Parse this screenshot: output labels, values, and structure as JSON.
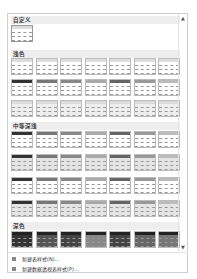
{
  "gallery": {
    "sections": [
      {
        "label": "自定义",
        "rows": 1,
        "cols": 1
      },
      {
        "label": "浅色",
        "rows": 3,
        "cols": 7
      },
      {
        "label": "中等深浅",
        "rows": 4,
        "cols": 7
      },
      {
        "label": "深色",
        "rows": 1,
        "cols": 7
      }
    ],
    "scroll_up_icon": "▲",
    "scroll_down_icon": "▼"
  },
  "menu": {
    "items": [
      {
        "label": "新建表样式(N)...",
        "icon": "new-table-style-icon"
      },
      {
        "label": "新建数据透视表样式(P)...",
        "icon": "new-pivot-style-icon"
      }
    ]
  },
  "colors": {
    "light_header": [
      "#333333",
      "#777777",
      "#888888",
      "#aaaaaa",
      "#666666",
      "#999999",
      "#bbbbbb"
    ],
    "dark_fill": [
      "#333333",
      "#555555",
      "#444444",
      "#888888",
      "#444444",
      "#666666",
      "#777777"
    ]
  }
}
